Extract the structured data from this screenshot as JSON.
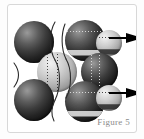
{
  "figure": {
    "caption": "Figure 5",
    "kind": "sphere-lattice-diagram",
    "frame_background": "#ffffff",
    "frame_border_color": "#d8d8d8",
    "page_background": "#fdfdfd",
    "caption_color": "#8a8a8a",
    "dark_sphere_color": "#111111",
    "light_sphere_color": "#c9c9c9",
    "arrow_color": "#000000",
    "outline_color": "#2b2b2b"
  },
  "spheres": [
    {
      "id": "dark-top-left",
      "shade": "dark",
      "marks": "none",
      "cx": 26,
      "cy": 36,
      "r": 20
    },
    {
      "id": "dark-top-center",
      "shade": "dark",
      "marks": "latitude",
      "cx": 77,
      "cy": 35,
      "r": 20
    },
    {
      "id": "light-top-right",
      "shade": "light",
      "marks": "latitude",
      "cx": 107,
      "cy": 38,
      "r": 13
    },
    {
      "id": "light-mid-center",
      "shade": "light",
      "marks": "longitude",
      "cx": 49,
      "cy": 67,
      "r": 20
    },
    {
      "id": "dark-mid-right",
      "shade": "dark",
      "marks": "longitude",
      "cx": 92,
      "cy": 66,
      "r": 18
    },
    {
      "id": "dark-bottom-left",
      "shade": "dark",
      "marks": "none",
      "cx": 26,
      "cy": 94,
      "r": 20
    },
    {
      "id": "dark-bottom-center",
      "shade": "dark",
      "marks": "latitude",
      "cx": 77,
      "cy": 95,
      "r": 20
    },
    {
      "id": "light-bottom-right",
      "shade": "light",
      "marks": "latitude",
      "cx": 107,
      "cy": 93,
      "r": 13
    }
  ],
  "arrows": [
    {
      "id": "arrow-upper",
      "direction": "right",
      "x": 104,
      "y": 33,
      "length": 33
    },
    {
      "id": "arrow-lower",
      "direction": "right",
      "x": 104,
      "y": 88,
      "length": 33
    }
  ]
}
